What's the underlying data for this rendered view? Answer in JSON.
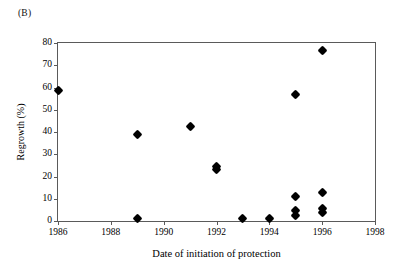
{
  "panel": {
    "label": "(B)"
  },
  "chart_data": {
    "type": "scatter",
    "title": "",
    "subtitle": "",
    "xlabel": "Date of initiation of protection",
    "ylabel": "Regrowth (%)",
    "xlim": [
      1986,
      1998
    ],
    "ylim": [
      0,
      80
    ],
    "xticks": [
      1986,
      1988,
      1990,
      1992,
      1994,
      1996,
      1998
    ],
    "xtick_labels": [
      "1986",
      "1988",
      "1990",
      "1992",
      "1994",
      "1996",
      "1998"
    ],
    "yticks": [
      0,
      10,
      20,
      30,
      40,
      50,
      60,
      70,
      80
    ],
    "ytick_labels": [
      "0",
      "10",
      "20",
      "30",
      "40",
      "50",
      "60",
      "70",
      "80"
    ],
    "grid": false,
    "legend": false,
    "legend_position": "none",
    "marker": "filled-diamond",
    "marker_color": "#000000",
    "series": [
      {
        "name": "Regrowth",
        "x": [
          1986,
          1989,
          1989,
          1991,
          1992,
          1992,
          1993,
          1994,
          1995,
          1995,
          1995,
          1995,
          1996,
          1996,
          1996,
          1996
        ],
        "y": [
          58.5,
          39.0,
          1.0,
          42.5,
          24.5,
          23.0,
          1.0,
          1.0,
          57.0,
          11.0,
          4.5,
          2.5,
          76.5,
          13.0,
          5.5,
          4.0
        ]
      }
    ],
    "points": [
      {
        "x": 1986,
        "y": 58.5
      },
      {
        "x": 1989,
        "y": 39.0
      },
      {
        "x": 1989,
        "y": 1.0
      },
      {
        "x": 1991,
        "y": 42.5
      },
      {
        "x": 1992,
        "y": 24.5
      },
      {
        "x": 1992,
        "y": 23.0
      },
      {
        "x": 1993,
        "y": 1.0
      },
      {
        "x": 1994,
        "y": 1.0
      },
      {
        "x": 1995,
        "y": 57.0
      },
      {
        "x": 1995,
        "y": 11.0
      },
      {
        "x": 1995,
        "y": 4.5
      },
      {
        "x": 1995,
        "y": 2.5
      },
      {
        "x": 1996,
        "y": 76.5
      },
      {
        "x": 1996,
        "y": 13.0
      },
      {
        "x": 1996,
        "y": 5.5
      },
      {
        "x": 1996,
        "y": 4.0
      }
    ]
  },
  "colors": {
    "axis": "#5a5a5a",
    "marker": "#000000",
    "background": "#ffffff",
    "text": "#000000"
  }
}
